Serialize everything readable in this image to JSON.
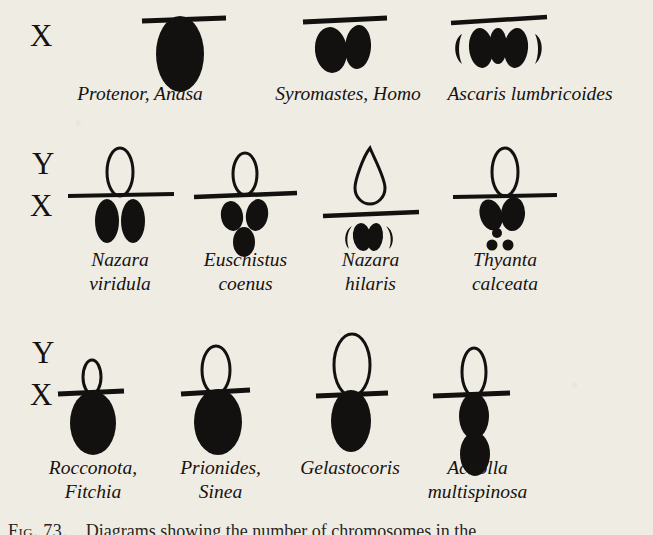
{
  "figure": {
    "title_alt": "Diagrams showing the sex chromosome complexes of various species",
    "background_color": "#efece4",
    "ink_color": "#13110f",
    "caption_number": "Fig. 73.",
    "caption_text": "Diagrams showing the number of chromosomes in the"
  },
  "rows": [
    {
      "id": "row-1",
      "axis_labels": [
        "X"
      ],
      "groups": [
        {
          "id": "protenor-anasa",
          "caption": "Protenor, Anasa",
          "diagram": {
            "type": "xo",
            "bar": true,
            "y_chromosome": null,
            "x_elements": [
              {
                "shape": "ellipse",
                "fill": "solid",
                "rx": 24,
                "ry": 38,
                "dx": 0,
                "dy": 38
              }
            ]
          }
        },
        {
          "id": "syromastes-homo",
          "caption": "Syromastes, Homo",
          "diagram": {
            "type": "xy-fused",
            "bar": true,
            "y_chromosome": null,
            "x_elements": [
              {
                "shape": "ellipse",
                "fill": "solid",
                "rx": 15,
                "ry": 22,
                "dx": -14,
                "dy": 26
              },
              {
                "shape": "ellipse",
                "fill": "solid",
                "rx": 13,
                "ry": 22,
                "dx": 13,
                "dy": 24
              }
            ]
          }
        },
        {
          "id": "ascaris-lumbricoides",
          "caption": "Ascaris lumbricoides",
          "diagram": {
            "type": "multiple",
            "bar": true,
            "y_chromosome": null,
            "x_elements": [
              {
                "shape": "crescent-left",
                "fill": "solid",
                "rx": 8,
                "ry": 20,
                "dx": -36,
                "dy": 25
              },
              {
                "shape": "ellipse",
                "fill": "solid",
                "rx": 13,
                "ry": 21,
                "dx": -18,
                "dy": 25
              },
              {
                "shape": "ellipse",
                "fill": "solid",
                "rx": 9,
                "ry": 19,
                "dx": 0,
                "dy": 24
              },
              {
                "shape": "ellipse",
                "fill": "solid",
                "rx": 13,
                "ry": 21,
                "dx": 18,
                "dy": 25
              },
              {
                "shape": "crescent-right",
                "fill": "solid",
                "rx": 8,
                "ry": 20,
                "dx": 36,
                "dy": 25
              }
            ]
          }
        }
      ]
    },
    {
      "id": "row-2",
      "axis_labels": [
        "Y",
        "X"
      ],
      "groups": [
        {
          "id": "nazara-viridula",
          "caption": "Nazara\nviridula",
          "diagram": {
            "type": "xy",
            "bar": true,
            "y_chromosome": {
              "shape": "ellipse-outline",
              "rx": 13,
              "ry": 24
            },
            "x_elements": [
              {
                "shape": "ellipse",
                "fill": "solid",
                "rx": 12,
                "ry": 22,
                "dx": -13,
                "dy": 26
              },
              {
                "shape": "ellipse",
                "fill": "solid",
                "rx": 12,
                "ry": 22,
                "dx": 13,
                "dy": 26
              }
            ]
          }
        },
        {
          "id": "euschistus-coenus",
          "caption": "Euschistus\ncoenus",
          "diagram": {
            "type": "xy",
            "bar": true,
            "y_chromosome": {
              "shape": "ellipse-outline",
              "rx": 12,
              "ry": 21
            },
            "x_elements": [
              {
                "shape": "ellipse",
                "fill": "solid",
                "rx": 11,
                "ry": 15,
                "dx": -13,
                "dy": 21
              },
              {
                "shape": "ellipse",
                "fill": "solid",
                "rx": 11,
                "ry": 16,
                "dx": 12,
                "dy": 20
              },
              {
                "shape": "ellipse",
                "fill": "solid",
                "rx": 11,
                "ry": 15,
                "dx": 0,
                "dy": 47
              }
            ]
          }
        },
        {
          "id": "nazara-hilaris",
          "caption": "Nazara\nhilaris",
          "diagram": {
            "type": "xy",
            "bar": true,
            "y_chromosome": {
              "shape": "pear-outline",
              "rx": 13,
              "ry": 26
            },
            "x_elements": [
              {
                "shape": "crescent-left",
                "fill": "solid",
                "rx": 8,
                "ry": 15,
                "dx": -21,
                "dy": 20
              },
              {
                "shape": "ellipse",
                "fill": "solid",
                "rx": 9,
                "ry": 17,
                "dx": -9,
                "dy": 20
              },
              {
                "shape": "ellipse",
                "fill": "solid",
                "rx": 8,
                "ry": 16,
                "dx": 4,
                "dy": 20
              },
              {
                "shape": "crescent-right",
                "fill": "solid",
                "rx": 8,
                "ry": 15,
                "dx": 16,
                "dy": 20
              }
            ]
          }
        },
        {
          "id": "thyanta-calceata",
          "caption": "Thyanta\ncalceata",
          "diagram": {
            "type": "xy",
            "bar": true,
            "y_chromosome": {
              "shape": "ellipse-outline",
              "rx": 13,
              "ry": 24
            },
            "x_elements": [
              {
                "shape": "ellipse",
                "fill": "solid",
                "rx": 11,
                "ry": 16,
                "dx": -13,
                "dy": 19
              },
              {
                "shape": "ellipse",
                "fill": "solid",
                "rx": 12,
                "ry": 17,
                "dx": 8,
                "dy": 18
              },
              {
                "shape": "circle",
                "fill": "solid",
                "rx": 5,
                "ry": 5,
                "dx": -7,
                "dy": 36
              },
              {
                "shape": "circle",
                "fill": "solid",
                "rx": 5,
                "ry": 5,
                "dx": -12,
                "dy": 47
              },
              {
                "shape": "circle",
                "fill": "solid",
                "rx": 5,
                "ry": 5,
                "dx": 3,
                "dy": 47
              }
            ]
          }
        }
      ]
    },
    {
      "id": "row-3",
      "axis_labels": [
        "Y",
        "X"
      ],
      "groups": [
        {
          "id": "rocconota-fitchia",
          "caption": "Rocconota,\nFitchia",
          "diagram": {
            "type": "xy",
            "bar": true,
            "y_chromosome": {
              "shape": "ellipse-outline",
              "rx": 9,
              "ry": 17
            },
            "x_elements": [
              {
                "shape": "ellipse",
                "fill": "solid",
                "rx": 22,
                "ry": 31,
                "dx": 0,
                "dy": 32
              }
            ]
          }
        },
        {
          "id": "prionides-sinea",
          "caption": "Prionides,\nSinea",
          "diagram": {
            "type": "xy",
            "bar": true,
            "y_chromosome": {
              "shape": "ellipse-outline",
              "rx": 14,
              "ry": 24
            },
            "x_elements": [
              {
                "shape": "ellipse",
                "fill": "solid",
                "rx": 23,
                "ry": 32,
                "dx": 0,
                "dy": 32
              }
            ]
          }
        },
        {
          "id": "gelastocoris",
          "caption": "Gelastocoris",
          "diagram": {
            "type": "xy",
            "bar": true,
            "y_chromosome": {
              "shape": "ellipse-outline",
              "rx": 17,
              "ry": 30
            },
            "x_elements": [
              {
                "shape": "ellipse",
                "fill": "solid",
                "rx": 20,
                "ry": 31,
                "dx": 0,
                "dy": 31
              }
            ]
          }
        },
        {
          "id": "acholla-multispinosa",
          "caption": "Acholla\nmultispinosa",
          "diagram": {
            "type": "xy",
            "bar": true,
            "y_chromosome": {
              "shape": "ellipse-outline",
              "rx": 12,
              "ry": 24
            },
            "x_elements": [
              {
                "shape": "ellipse",
                "fill": "solid",
                "rx": 14,
                "ry": 23,
                "dx": 0,
                "dy": 22
              },
              {
                "shape": "ellipse",
                "fill": "solid",
                "rx": 14,
                "ry": 22,
                "dx": 0,
                "dy": 62
              }
            ]
          }
        }
      ]
    }
  ]
}
